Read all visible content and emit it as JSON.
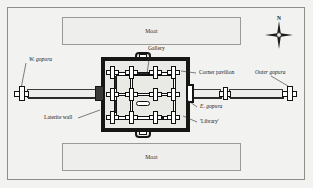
{
  "figure": {
    "type": "archaeological-site-plan"
  },
  "moats": {
    "north_label": "Moat",
    "south_label": "Moat"
  },
  "compass": {
    "north_label": "N",
    "icon": "compass-rose-icon"
  },
  "labels": {
    "gallery": "Gallery",
    "corner_pavilion": "Corner pavilion",
    "outer_gopura": "Outer gopura",
    "east_gopura": "E. gopura",
    "west_gopura": "W. gopura",
    "laterite_wall": "Laterite wall",
    "library": "'Library'"
  },
  "colors": {
    "page_background": "#f2f2f0",
    "ink": "#161614",
    "moat_fill": "#eeeeec",
    "moat_stroke": "#9a9a96",
    "frame_stroke": "#8d8d8a",
    "enclosure_fill": "#e9e9e6"
  },
  "structures": {
    "enclosure": "laterite-wall-enclosure",
    "west_causeway": "west-causeway",
    "east_causeway_inner": "east-causeway-inner",
    "east_causeway_outer": "east-causeway-outer",
    "central_library": "library-structure"
  }
}
